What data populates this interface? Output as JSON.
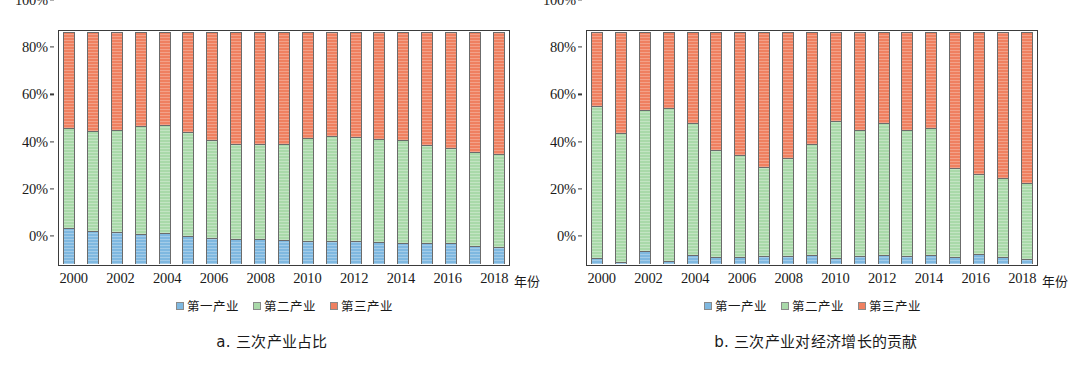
{
  "figure": {
    "axis_unit_label": "年份",
    "y_ticks": [
      "0%",
      "20%",
      "40%",
      "60%",
      "80%",
      "100%"
    ],
    "x_ticks": [
      "2000",
      "2002",
      "2004",
      "2006",
      "2008",
      "2010",
      "2012",
      "2014",
      "2016",
      "2018"
    ],
    "legend": [
      {
        "label": "第一产业",
        "color": "#7fb8e0"
      },
      {
        "label": "第二产业",
        "color": "#a9d9a9"
      },
      {
        "label": "第三产业",
        "color": "#ef8060"
      }
    ],
    "panels": [
      {
        "id": "a",
        "caption": "a. 三次产业占比"
      },
      {
        "id": "b",
        "caption": "b. 三次产业对经济增长的贡献"
      }
    ]
  },
  "chart_data": [
    {
      "type": "bar",
      "subtype": "stacked-percent",
      "title": "a. 三次产业占比",
      "xlabel": "年份",
      "ylabel": "",
      "ylim": [
        0,
        100
      ],
      "yticks": [
        0,
        20,
        40,
        60,
        80,
        100
      ],
      "grid": false,
      "legend_position": "bottom",
      "categories": [
        "2000",
        "2001",
        "2002",
        "2003",
        "2004",
        "2005",
        "2006",
        "2007",
        "2008",
        "2009",
        "2010",
        "2011",
        "2012",
        "2013",
        "2014",
        "2015",
        "2016",
        "2017",
        "2018"
      ],
      "series": [
        {
          "name": "第一产业",
          "color": "#7fb8e0",
          "values": [
            15.6,
            14.4,
            13.7,
            12.8,
            13.4,
            12.1,
            11.1,
            10.8,
            10.7,
            10.3,
            9.9,
            9.8,
            9.8,
            9.5,
            9.2,
            9.0,
            8.9,
            7.9,
            7.2
          ]
        },
        {
          "name": "第二产业",
          "color": "#a9d9a9",
          "values": [
            42.9,
            43.1,
            44.2,
            46.8,
            46.5,
            44.6,
            42.3,
            40.9,
            41.1,
            41.5,
            44.6,
            45.3,
            44.9,
            44.3,
            44.4,
            42.3,
            41.0,
            40.2,
            40.4
          ]
        },
        {
          "name": "第三产业",
          "color": "#ef8060",
          "values": [
            41.5,
            42.5,
            42.1,
            40.4,
            40.1,
            43.3,
            46.6,
            48.3,
            48.2,
            48.2,
            45.5,
            44.9,
            45.3,
            46.2,
            46.4,
            48.7,
            50.1,
            51.9,
            52.4
          ]
        }
      ]
    },
    {
      "type": "bar",
      "subtype": "stacked-percent",
      "title": "b. 三次产业对经济增长的贡献",
      "xlabel": "年份",
      "ylabel": "",
      "ylim": [
        0,
        100
      ],
      "yticks": [
        0,
        20,
        40,
        60,
        80,
        100
      ],
      "grid": false,
      "legend_position": "bottom",
      "categories": [
        "2000",
        "2001",
        "2002",
        "2003",
        "2004",
        "2005",
        "2006",
        "2007",
        "2008",
        "2009",
        "2010",
        "2011",
        "2012",
        "2013",
        "2014",
        "2015",
        "2016",
        "2017",
        "2018"
      ],
      "series": [
        {
          "name": "第一产业",
          "color": "#7fb8e0",
          "values": [
            2.5,
            0.8,
            5.8,
            1.2,
            3.8,
            3.2,
            3.0,
            3.4,
            3.6,
            3.8,
            2.6,
            3.3,
            4.0,
            3.5,
            4.0,
            3.2,
            4.3,
            3.2,
            2.3
          ]
        },
        {
          "name": "第二产业",
          "color": "#a9d9a9",
          "values": [
            65.4,
            55.7,
            60.6,
            66.2,
            56.9,
            45.9,
            43.8,
            38.6,
            42.3,
            47.8,
            59.0,
            54.6,
            57.0,
            54.3,
            54.8,
            38.1,
            34.6,
            33.7,
            32.8
          ]
        },
        {
          "name": "第三产业",
          "color": "#ef8060",
          "values": [
            32.1,
            43.5,
            33.6,
            32.6,
            39.3,
            50.9,
            53.2,
            58.0,
            54.1,
            48.4,
            38.4,
            42.1,
            39.0,
            42.2,
            41.2,
            58.7,
            61.1,
            63.1,
            64.9
          ]
        }
      ]
    }
  ]
}
